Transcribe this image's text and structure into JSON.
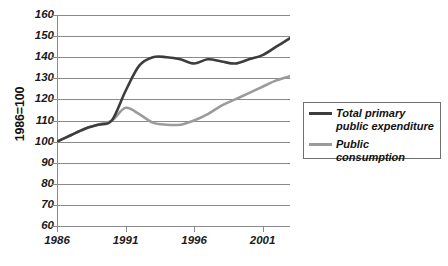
{
  "chart_data": {
    "type": "line",
    "title": "",
    "xlabel": "",
    "ylabel": "1986=100",
    "xlim": [
      1986,
      2003
    ],
    "ylim": [
      60,
      160
    ],
    "ytick_step": 10,
    "grid": true,
    "legend_position": "right",
    "yticks": [
      160,
      150,
      140,
      130,
      120,
      110,
      100,
      90,
      80,
      70,
      60
    ],
    "xticks": [
      1986,
      1991,
      1996,
      2001
    ],
    "x": [
      1986,
      1987,
      1988,
      1989,
      1990,
      1991,
      1992,
      1993,
      1994,
      1995,
      1996,
      1997,
      1998,
      1999,
      2000,
      2001,
      2002,
      2003
    ],
    "series": [
      {
        "name": "Total primary public expenditure",
        "color": "#3d3d3d",
        "values": [
          100,
          103,
          106,
          108,
          110,
          124,
          136,
          140,
          140,
          139,
          137,
          139,
          138,
          137,
          139,
          141,
          145,
          149
        ]
      },
      {
        "name": "Public consumption",
        "color": "#9b9b9b",
        "values": [
          100,
          103,
          106,
          108,
          110,
          116,
          113,
          109,
          108,
          108,
          110,
          113,
          117,
          120,
          123,
          126,
          129,
          131
        ]
      }
    ]
  },
  "axis": {
    "y_title": "1986=100",
    "y_tick_labels": [
      "160",
      "150",
      "140",
      "130",
      "120",
      "110",
      "100",
      "90",
      "80",
      "70",
      "60"
    ],
    "x_tick_labels": [
      "1986",
      "1991",
      "1996",
      "2001"
    ]
  },
  "legend": {
    "items": [
      {
        "label": "Total primary public expenditure",
        "color": "#3d3d3d"
      },
      {
        "label": "Public consumption",
        "color": "#9b9b9b"
      }
    ]
  }
}
